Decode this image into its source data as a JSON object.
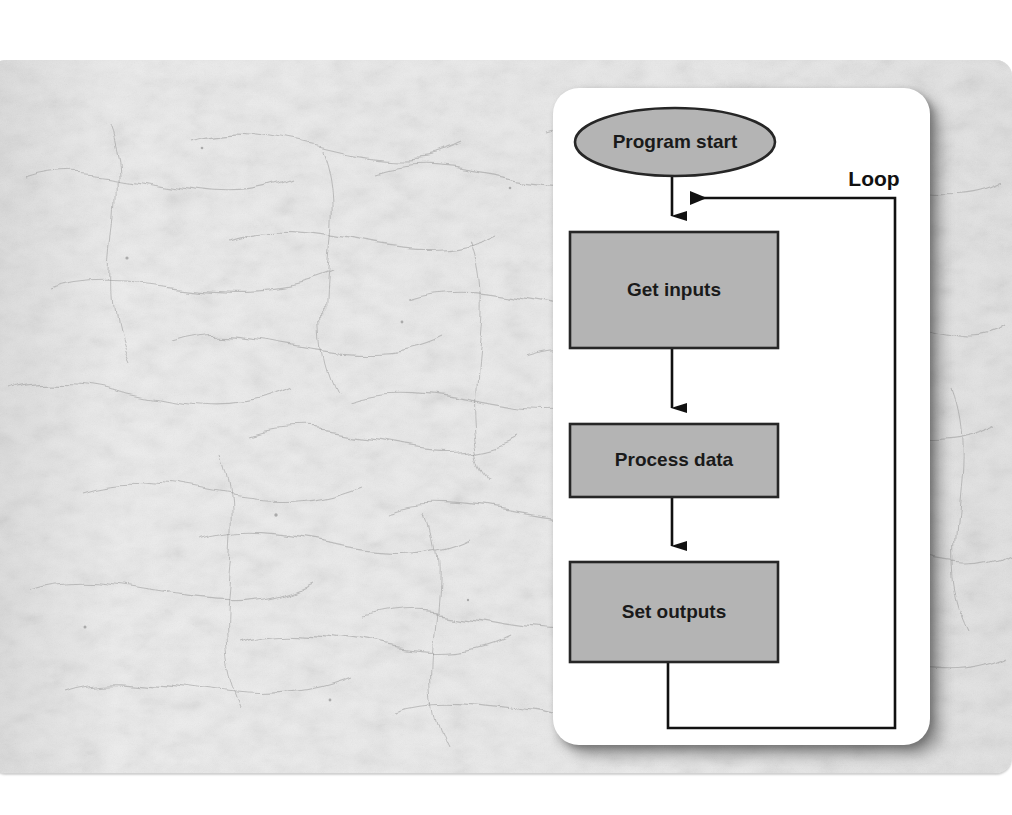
{
  "page": {
    "background_color": "#ffffff",
    "paper_color": "#e9e9e9",
    "card_color": "#ffffff",
    "node_fill": "#b4b4b4",
    "node_stroke": "#262626",
    "line_color": "#111111",
    "text_color": "#1a1a1a"
  },
  "diagram": {
    "type": "flowchart",
    "orientation": "top-to-bottom-with-feedback-loop",
    "nodes": [
      {
        "id": "start",
        "label": "Program start",
        "shape": "ellipse",
        "order": 1
      },
      {
        "id": "inputs",
        "label": "Get inputs",
        "shape": "rectangle",
        "order": 2
      },
      {
        "id": "process",
        "label": "Process data",
        "shape": "rectangle",
        "order": 3
      },
      {
        "id": "outputs",
        "label": "Set outputs",
        "shape": "rectangle",
        "order": 4
      }
    ],
    "edges": [
      {
        "from": "start",
        "to": "inputs",
        "label": "",
        "arrow": true
      },
      {
        "from": "inputs",
        "to": "process",
        "label": "",
        "arrow": true
      },
      {
        "from": "process",
        "to": "outputs",
        "label": "",
        "arrow": true
      },
      {
        "from": "outputs",
        "to": "inputs",
        "label": "Loop",
        "arrow": true,
        "routing": "down-right-up-left"
      }
    ],
    "labels": {
      "loop": "Loop"
    }
  }
}
